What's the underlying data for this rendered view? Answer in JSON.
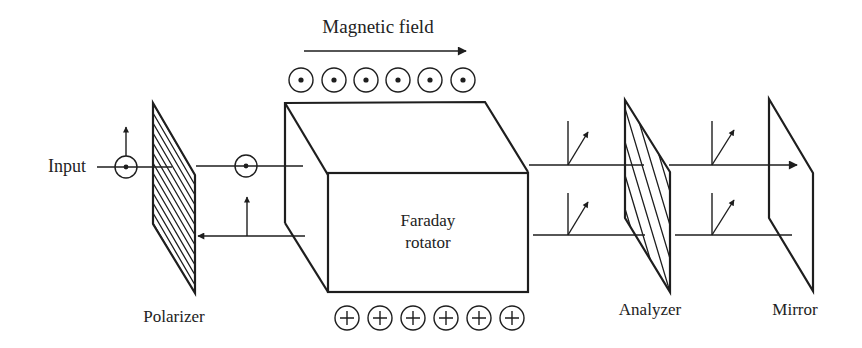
{
  "diagram": {
    "labels": {
      "magnetic_field": "Magnetic field",
      "input": "Input",
      "polarizer": "Polarizer",
      "rotator_line1": "Faraday",
      "rotator_line2": "rotator",
      "analyzer": "Analyzer",
      "mirror": "Mirror"
    },
    "field_symbols": {
      "top_row": {
        "symbol": "dot-in-circle",
        "meaning": "field out of page",
        "count": 6
      },
      "bottom_row": {
        "symbol": "plus-in-circle",
        "meaning": "field into page",
        "count": 6
      }
    },
    "components": [
      {
        "name": "Polarizer",
        "type": "hatched-plate"
      },
      {
        "name": "Faraday rotator",
        "type": "box"
      },
      {
        "name": "Analyzer",
        "type": "hatched-plate"
      },
      {
        "name": "Mirror",
        "type": "plate"
      }
    ],
    "beams": {
      "forward": "Input → Polarizer → Faraday rotator → Analyzer → Mirror",
      "return": "Mirror → Analyzer → Faraday rotator → Polarizer (blocked)"
    },
    "colors": {
      "ink": "#1e1e1e",
      "background": "#ffffff"
    }
  }
}
